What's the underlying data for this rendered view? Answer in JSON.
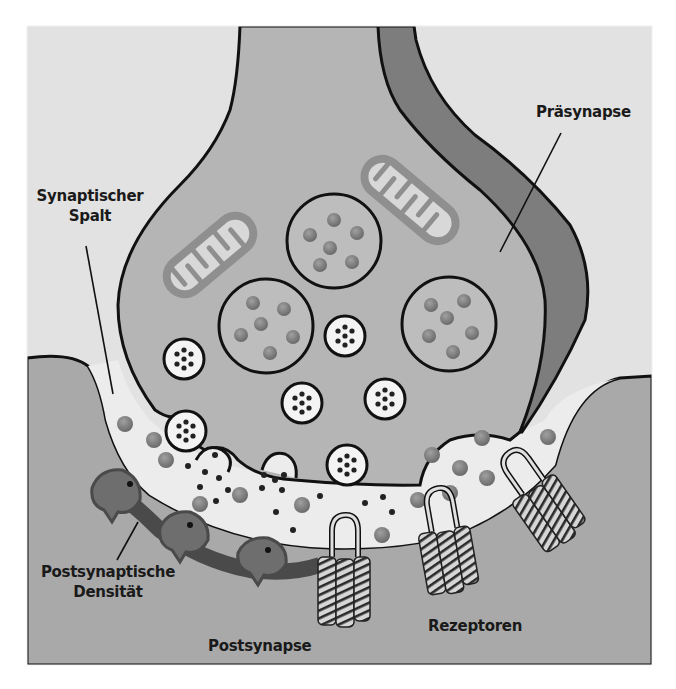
{
  "figure": {
    "labels": {
      "presynapse": "Präsynapse",
      "synaptic_cleft_line1": "Synaptischer",
      "synaptic_cleft_line2": "Spalt",
      "psd_line1": "Postsynaptische",
      "psd_line2": "Densität",
      "receptors": "Rezeptoren",
      "postsynapse": "Postsynapse"
    },
    "colors": {
      "background": "#e2e2e2",
      "presynapse_fill": "#b5b5b5",
      "presynapse_band": "#7d7d7d",
      "postsynapse_fill": "#a9a9a9",
      "cleft_fill": "#ececec",
      "outline": "#111111",
      "mitochondria": "#8f8f8f",
      "granule": "#7a7a7a",
      "psd_protein": "#6e6e6e"
    }
  }
}
